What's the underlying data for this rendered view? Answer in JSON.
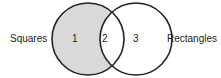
{
  "diagram": {
    "type": "venn",
    "sets": [
      {
        "name": "Squares",
        "region_label": "1",
        "shaded": true
      },
      {
        "name": "Rectangles",
        "region_label": "3",
        "shaded": false
      }
    ],
    "intersection_label": "2",
    "colors": {
      "shade": "#d9d9d9",
      "stroke": "#222222",
      "text": "#222222"
    }
  }
}
